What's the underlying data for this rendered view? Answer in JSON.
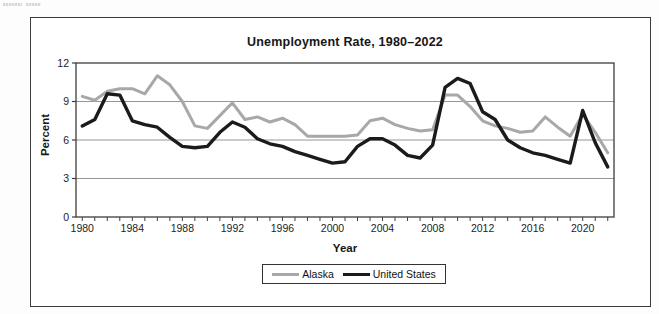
{
  "page": {
    "fine_print": "illegible fine print at page corner"
  },
  "chart_data": {
    "type": "line",
    "title": "Unemployment Rate, 1980–2022",
    "xlabel": "Year",
    "ylabel": "Percent",
    "ylim": [
      0,
      12
    ],
    "yticks": [
      0,
      3,
      6,
      9,
      12
    ],
    "xtick_labels": [
      1980,
      1984,
      1988,
      1992,
      1996,
      2000,
      2004,
      2008,
      2012,
      2016,
      2020
    ],
    "grid": true,
    "gridline_values": [
      3,
      6,
      9
    ],
    "legend_position": "bottom",
    "colors": {
      "alaska": "#a8a8a8",
      "united_states": "#1b1b1b",
      "gridline": "#969696",
      "frame": "#3d3d3d",
      "tick_text": "#1d1d1d"
    },
    "years": [
      1980,
      1981,
      1982,
      1983,
      1984,
      1985,
      1986,
      1987,
      1988,
      1989,
      1990,
      1991,
      1992,
      1993,
      1994,
      1995,
      1996,
      1997,
      1998,
      1999,
      2000,
      2001,
      2002,
      2003,
      2004,
      2005,
      2006,
      2007,
      2008,
      2009,
      2010,
      2011,
      2012,
      2013,
      2014,
      2015,
      2016,
      2017,
      2018,
      2019,
      2020,
      2021,
      2022
    ],
    "series": [
      {
        "name": "Alaska",
        "color_key": "alaska",
        "stroke_width": 3,
        "values": [
          9.4,
          9.1,
          9.8,
          10.0,
          10.0,
          9.6,
          11.0,
          10.3,
          9.0,
          7.1,
          6.9,
          7.9,
          8.9,
          7.6,
          7.8,
          7.4,
          7.7,
          7.2,
          6.3,
          6.3,
          6.3,
          6.3,
          6.4,
          7.5,
          7.7,
          7.2,
          6.9,
          6.7,
          6.8,
          9.5,
          9.5,
          8.6,
          7.5,
          7.1,
          6.9,
          6.6,
          6.7,
          7.8,
          7.0,
          6.3,
          8.0,
          6.6,
          5.0
        ]
      },
      {
        "name": "United States",
        "color_key": "united_states",
        "stroke_width": 3.4,
        "values": [
          7.1,
          7.6,
          9.6,
          9.5,
          7.5,
          7.2,
          7.0,
          6.2,
          5.5,
          5.4,
          5.5,
          6.6,
          7.4,
          7.0,
          6.1,
          5.7,
          5.5,
          5.1,
          4.8,
          4.5,
          4.2,
          4.3,
          5.5,
          6.1,
          6.1,
          5.6,
          4.8,
          4.6,
          5.6,
          10.1,
          10.8,
          10.4,
          8.2,
          7.6,
          6.0,
          5.4,
          5.0,
          4.8,
          4.5,
          4.2,
          8.3,
          5.8,
          3.9
        ]
      }
    ]
  }
}
